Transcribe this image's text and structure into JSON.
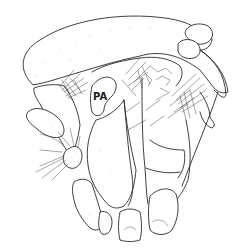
{
  "figure": {
    "labels": [
      {
        "id": "PA",
        "text": "PA"
      }
    ],
    "colors": {
      "line": "#2a2a2a",
      "background": "#ffffff"
    }
  }
}
